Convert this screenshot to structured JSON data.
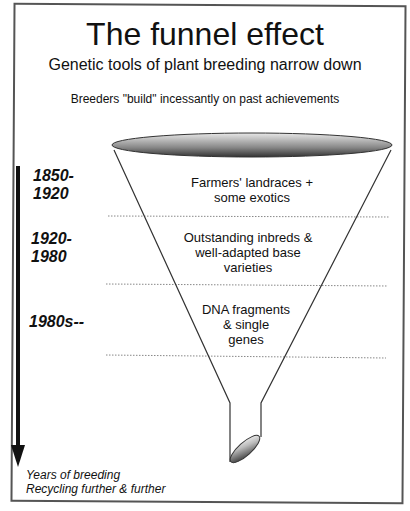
{
  "title": "The funnel effect",
  "subtitle": "Genetic tools of plant breeding narrow down",
  "note": "Breeders \"build\" incessantly on past achievements",
  "eras": [
    {
      "period": "1850-\n1920",
      "period_line1": "1850-",
      "period_line2": "1920",
      "description_line1": "Farmers' landraces +",
      "description_line2": "some exotics",
      "description_line3": ""
    },
    {
      "period_line1": "1920-",
      "period_line2": "1980",
      "description_line1": "Outstanding inbreds &",
      "description_line2": "well-adapted base",
      "description_line3": "varieties"
    },
    {
      "period_line1": "1980s--",
      "period_line2": "",
      "description_line1": "DNA fragments",
      "description_line2": "& single",
      "description_line3": "genes"
    }
  ],
  "axis": {
    "label_line1": "Years of breeding",
    "label_line2": "Recycling further & further"
  }
}
